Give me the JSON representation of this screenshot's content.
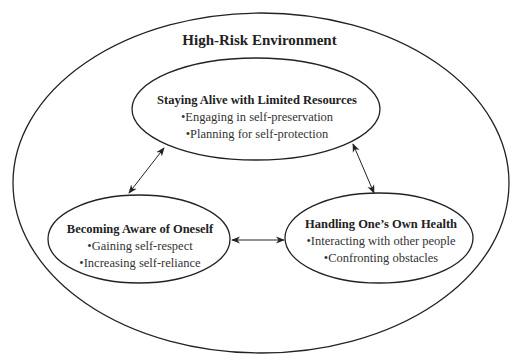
{
  "diagram": {
    "container": {
      "label": "High-Risk Environment"
    },
    "nodes": [
      {
        "id": "top",
        "title": "Staying Alive with Limited Resources",
        "bullets": [
          "•Engaging in self-preservation",
          "•Planning for self-protection"
        ]
      },
      {
        "id": "left",
        "title": "Becoming Aware of Oneself",
        "bullets": [
          "•Gaining self-respect",
          "•Increasing self-reliance"
        ]
      },
      {
        "id": "right",
        "title": "Handling One’s Own Health",
        "bullets": [
          "•Interacting with other people",
          "•Confronting obstacles"
        ]
      }
    ],
    "edges": [
      {
        "from": "top",
        "to": "left",
        "type": "bidirectional"
      },
      {
        "from": "top",
        "to": "right",
        "type": "bidirectional"
      },
      {
        "from": "left",
        "to": "right",
        "type": "bidirectional"
      }
    ],
    "colors": {
      "stroke": "#222222",
      "background": "#ffffff"
    }
  }
}
